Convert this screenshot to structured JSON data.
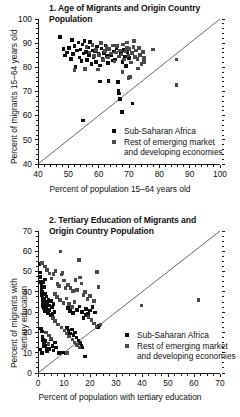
{
  "figure": {
    "background": "#ffffff",
    "ink": "#1a1a1a"
  },
  "legend_common": {
    "series1_label": "Sub-Saharan Africa",
    "series2_label_line1": "Rest of emerging market",
    "series2_label_line2": "and developing economies",
    "series1_color": "#0d0d0d",
    "series2_color": "#4a4a4a"
  },
  "chart_data": [
    {
      "id": "panel-1",
      "type": "scatter",
      "title": "1. Age of Migrants and Origin Country Population",
      "title_line1": "1. Age of Migrants and Origin Country",
      "title_line2": "Population",
      "xlabel": "Percent of population 15–64 years old",
      "ylabel": "Percent of migrants 15–64 years old",
      "xlim": [
        40,
        100
      ],
      "ylim": [
        40,
        100
      ],
      "xticks": [
        40,
        50,
        60,
        70,
        80,
        90,
        100
      ],
      "yticks": [
        40,
        50,
        60,
        70,
        80,
        90,
        100
      ],
      "minor_tick_step": 2,
      "grid": false,
      "legend_position": "center-right",
      "annotations": [
        "45-degree reference line from (40,40) to (100,100)"
      ],
      "series": [
        {
          "name": "Sub-Saharan Africa",
          "color": "#0d0d0d",
          "points": [
            [
              47.3,
              92.6
            ],
            [
              48.4,
              87.6
            ],
            [
              48.9,
              84.9
            ],
            [
              49.5,
              86.2
            ],
            [
              50.3,
              88.1
            ],
            [
              50.8,
              83.4
            ],
            [
              51.2,
              91.2
            ],
            [
              51.6,
              85.5
            ],
            [
              52.1,
              88.8
            ],
            [
              52.4,
              80.2
            ],
            [
              52.9,
              86.9
            ],
            [
              53.3,
              90.3
            ],
            [
              53.7,
              84.1
            ],
            [
              54.0,
              87.3
            ],
            [
              54.4,
              82.6
            ],
            [
              54.7,
              89.5
            ],
            [
              55.0,
              85.8
            ],
            [
              55.3,
              91.0
            ],
            [
              55.6,
              79.3
            ],
            [
              55.9,
              86.4
            ],
            [
              56.2,
              83.0
            ],
            [
              56.5,
              88.2
            ],
            [
              56.9,
              85.1
            ],
            [
              57.2,
              90.6
            ],
            [
              57.6,
              81.4
            ],
            [
              57.9,
              87.0
            ],
            [
              58.3,
              84.3
            ],
            [
              58.7,
              86.7
            ],
            [
              59.1,
              82.1
            ],
            [
              59.5,
              88.6
            ],
            [
              60.0,
              85.4
            ],
            [
              60.4,
              80.8
            ],
            [
              60.9,
              87.8
            ],
            [
              61.3,
              83.6
            ],
            [
              61.8,
              86.0
            ],
            [
              62.2,
              89.1
            ],
            [
              62.7,
              84.7
            ],
            [
              63.1,
              81.9
            ],
            [
              63.6,
              87.4
            ],
            [
              64.0,
              85.0
            ],
            [
              64.5,
              82.8
            ],
            [
              65.0,
              86.5
            ],
            [
              65.4,
              83.2
            ],
            [
              65.9,
              88.0
            ],
            [
              66.3,
              74.0
            ],
            [
              66.6,
              70.1
            ],
            [
              66.8,
              69.2
            ],
            [
              67.0,
              67.0
            ],
            [
              67.4,
              85.6
            ],
            [
              67.8,
              82.3
            ],
            [
              68.2,
              87.1
            ],
            [
              68.6,
              84.4
            ],
            [
              69.0,
              80.5
            ],
            [
              69.5,
              86.3
            ],
            [
              70.0,
              83.8
            ],
            [
              54.9,
              58.0
            ],
            [
              60.5,
              74.1
            ],
            [
              63.2,
              74.3
            ],
            [
              67.6,
              61.6
            ],
            [
              71.2,
              65.1
            ]
          ]
        },
        {
          "name": "Rest of emerging market and developing economies",
          "color": "#4a4a4a",
          "points": [
            [
              56.0,
              88.5
            ],
            [
              57.0,
              86.1
            ],
            [
              58.0,
              89.3
            ],
            [
              58.5,
              84.8
            ],
            [
              59.2,
              87.2
            ],
            [
              60.1,
              85.2
            ],
            [
              60.8,
              90.0
            ],
            [
              61.5,
              83.1
            ],
            [
              62.0,
              86.8
            ],
            [
              62.6,
              88.4
            ],
            [
              63.0,
              84.0
            ],
            [
              63.5,
              87.6
            ],
            [
              64.1,
              85.7
            ],
            [
              64.8,
              89.0
            ],
            [
              65.2,
              82.4
            ],
            [
              65.7,
              86.2
            ],
            [
              66.1,
              88.9
            ],
            [
              66.7,
              84.5
            ],
            [
              67.1,
              87.0
            ],
            [
              67.5,
              85.3
            ],
            [
              68.0,
              89.4
            ],
            [
              68.4,
              83.3
            ],
            [
              68.9,
              86.6
            ],
            [
              69.3,
              88.1
            ],
            [
              69.8,
              84.9
            ],
            [
              70.2,
              87.5
            ],
            [
              70.6,
              82.0
            ],
            [
              71.0,
              85.9
            ],
            [
              71.5,
              88.3
            ],
            [
              71.9,
              84.2
            ],
            [
              72.3,
              86.9
            ],
            [
              72.8,
              83.5
            ],
            [
              73.2,
              87.9
            ],
            [
              73.7,
              85.0
            ],
            [
              74.1,
              81.3
            ],
            [
              74.6,
              86.4
            ],
            [
              75.0,
              83.9
            ],
            [
              69.4,
              90.2
            ],
            [
              71.7,
              90.8
            ],
            [
              67.9,
              78.0
            ],
            [
              70.3,
              76.0
            ],
            [
              69.9,
              75.6
            ],
            [
              78.0,
              87.4
            ],
            [
              85.6,
              83.3
            ],
            [
              85.6,
              72.8
            ],
            [
              74.9,
              82.2
            ],
            [
              73.0,
              79.6
            ],
            [
              59.8,
              79.1
            ],
            [
              55.5,
              79.2
            ],
            [
              52.0,
              79.0
            ]
          ]
        }
      ]
    },
    {
      "id": "panel-2",
      "type": "scatter",
      "title": "2. Tertiary Education of Migrants and Origin Country Population",
      "title_line1": "2. Tertiary Education of Migrants and",
      "title_line2": "Origin Country Population",
      "xlabel": "Percent of population with tertiary education",
      "ylabel_line1": "Percent of migrants with",
      "ylabel_line2": "tertiary education",
      "xlim": [
        0,
        70
      ],
      "ylim": [
        0,
        70
      ],
      "xticks": [
        0,
        10,
        20,
        30,
        40,
        50,
        60,
        70
      ],
      "yticks": [
        0,
        10,
        20,
        30,
        40,
        50,
        60,
        70
      ],
      "minor_tick_step": 2.5,
      "grid": false,
      "legend_position": "center-right",
      "annotations": [
        "45-degree reference line from (0,0) to (70,70)"
      ],
      "series": [
        {
          "name": "Sub-Saharan Africa",
          "color": "#0d0d0d",
          "points": [
            [
              0.6,
              53.8
            ],
            [
              0.8,
              49.5
            ],
            [
              1.0,
              47.2
            ],
            [
              1.1,
              45.0
            ],
            [
              1.3,
              43.6
            ],
            [
              1.4,
              41.8
            ],
            [
              1.5,
              40.2
            ],
            [
              1.6,
              38.5
            ],
            [
              1.7,
              37.1
            ],
            [
              1.8,
              35.8
            ],
            [
              1.9,
              34.4
            ],
            [
              2.0,
              33.0
            ],
            [
              2.1,
              44.8
            ],
            [
              2.2,
              42.5
            ],
            [
              2.3,
              36.6
            ],
            [
              2.4,
              31.8
            ],
            [
              2.5,
              30.5
            ],
            [
              2.6,
              46.0
            ],
            [
              2.7,
              39.0
            ],
            [
              2.8,
              35.0
            ],
            [
              2.9,
              33.6
            ],
            [
              3.0,
              32.2
            ],
            [
              3.2,
              37.8
            ],
            [
              3.4,
              34.8
            ],
            [
              3.6,
              30.9
            ],
            [
              3.8,
              29.5
            ],
            [
              4.0,
              36.0
            ],
            [
              4.2,
              33.2
            ],
            [
              4.5,
              31.0
            ],
            [
              4.8,
              28.6
            ],
            [
              5.0,
              35.5
            ],
            [
              5.3,
              32.5
            ],
            [
              5.6,
              29.0
            ],
            [
              6.0,
              34.0
            ],
            [
              6.4,
              30.2
            ],
            [
              1.2,
              22.0
            ],
            [
              1.5,
              20.5
            ],
            [
              1.8,
              18.0
            ],
            [
              2.0,
              16.2
            ],
            [
              2.2,
              14.5
            ],
            [
              2.4,
              13.0
            ],
            [
              1.0,
              11.5
            ],
            [
              1.3,
              10.2
            ],
            [
              1.6,
              9.8
            ],
            [
              2.6,
              15.8
            ],
            [
              2.9,
              13.5
            ],
            [
              3.2,
              12.0
            ],
            [
              3.5,
              10.5
            ],
            [
              4.0,
              14.0
            ],
            [
              4.4,
              11.8
            ],
            [
              5.0,
              16.5
            ],
            [
              5.5,
              13.2
            ],
            [
              6.0,
              11.0
            ],
            [
              6.5,
              15.0
            ],
            [
              7.0,
              12.6
            ],
            [
              8.0,
              10.0
            ],
            [
              9.2,
              10.1
            ],
            [
              10.5,
              9.8
            ],
            [
              11.2,
              22.3
            ],
            [
              11.8,
              20.8
            ],
            [
              12.4,
              19.5
            ],
            [
              13.0,
              21.5
            ],
            [
              13.6,
              18.8
            ],
            [
              14.2,
              20.0
            ],
            [
              14.8,
              17.5
            ],
            [
              15.5,
              16.0
            ],
            [
              16.2,
              14.8
            ],
            [
              16.8,
              13.6
            ],
            [
              17.5,
              27.0
            ],
            [
              18.2,
              28.5
            ],
            [
              11.5,
              32.0
            ],
            [
              12.2,
              30.6
            ],
            [
              13.5,
              29.5
            ],
            [
              15.0,
              31.2
            ],
            [
              16.0,
              32.8
            ],
            [
              17.0,
              30.0
            ],
            [
              18.5,
              31.5
            ],
            [
              19.2,
              29.2
            ],
            [
              20.0,
              30.8
            ],
            [
              21.0,
              32.4
            ],
            [
              22.0,
              29.8
            ],
            [
              23.0,
              22.5
            ],
            [
              23.5,
              23.5
            ],
            [
              18.0,
              8.2
            ],
            [
              17.0,
              12.5
            ]
          ]
        },
        {
          "name": "Rest of emerging market and developing economies",
          "color": "#4a4a4a",
          "points": [
            [
              1.5,
              54.2
            ],
            [
              2.8,
              52.5
            ],
            [
              3.5,
              50.8
            ],
            [
              4.5,
              49.0
            ],
            [
              5.2,
              46.5
            ],
            [
              6.0,
              48.8
            ],
            [
              6.8,
              50.2
            ],
            [
              7.5,
              44.0
            ],
            [
              8.0,
              43.0
            ],
            [
              8.6,
              59.8
            ],
            [
              9.0,
              48.5
            ],
            [
              9.5,
              49.2
            ],
            [
              10.0,
              45.5
            ],
            [
              10.6,
              41.8
            ],
            [
              11.5,
              43.5
            ],
            [
              12.5,
              42.0
            ],
            [
              13.5,
              40.5
            ],
            [
              14.5,
              45.8
            ],
            [
              15.0,
              41.0
            ],
            [
              15.8,
              55.8
            ],
            [
              16.2,
              47.0
            ],
            [
              16.8,
              44.2
            ],
            [
              17.5,
              38.5
            ],
            [
              18.0,
              40.0
            ],
            [
              19.0,
              36.5
            ],
            [
              20.0,
              38.0
            ],
            [
              21.5,
              35.5
            ],
            [
              22.8,
              49.8
            ],
            [
              23.2,
              42.5
            ],
            [
              6.5,
              39.0
            ],
            [
              7.2,
              37.5
            ],
            [
              8.5,
              36.0
            ],
            [
              9.8,
              34.5
            ],
            [
              11.0,
              36.8
            ],
            [
              12.0,
              34.0
            ],
            [
              13.0,
              32.5
            ],
            [
              14.0,
              35.0
            ],
            [
              5.8,
              27.0
            ],
            [
              6.5,
              25.5
            ],
            [
              7.8,
              24.0
            ],
            [
              9.0,
              22.5
            ],
            [
              10.2,
              21.0
            ],
            [
              11.0,
              19.5
            ],
            [
              12.0,
              18.0
            ],
            [
              13.2,
              16.5
            ],
            [
              14.0,
              15.0
            ],
            [
              15.0,
              13.8
            ],
            [
              16.0,
              12.5
            ],
            [
              11.2,
              10.0
            ],
            [
              4.2,
              18.5
            ],
            [
              5.0,
              17.0
            ],
            [
              4.0,
              14.2
            ],
            [
              3.0,
              20.0
            ],
            [
              19.5,
              27.5
            ],
            [
              20.5,
              26.0
            ],
            [
              21.5,
              24.5
            ],
            [
              22.5,
              23.0
            ],
            [
              39.8,
              33.2
            ],
            [
              61.8,
              36.0
            ],
            [
              24.0,
              24.0
            ]
          ]
        }
      ]
    }
  ]
}
